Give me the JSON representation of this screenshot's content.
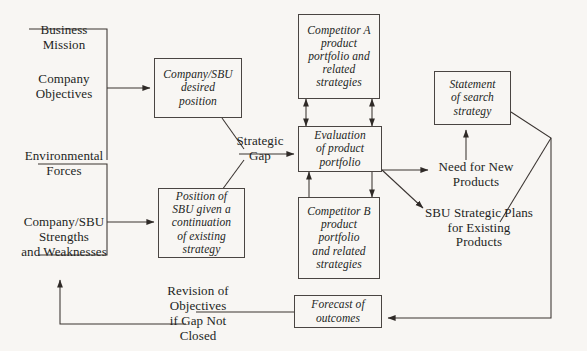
{
  "diagram": {
    "background_color": "#f8f6f3",
    "line_color": "#3a3431",
    "text_color": "#231f1d"
  },
  "inputs": [
    {
      "id": "business-mission",
      "label": "Business\nMission"
    },
    {
      "id": "company-objectives",
      "label": "Company\nObjectives"
    },
    {
      "id": "environmental-forces",
      "label": "Environmental\nForces"
    },
    {
      "id": "company-sbu-strengths",
      "label": "Company/SBU\nStrengths\nand Weaknesses"
    }
  ],
  "boxes": [
    {
      "id": "desired-position",
      "label": "Company/SBU\ndesired\nposition"
    },
    {
      "id": "position-continuation",
      "label": "Position of\nSBU given a\ncontinuation\nof existing\nstrategy"
    },
    {
      "id": "competitor-a",
      "label": "Competitor A\nproduct\nportfolio and\nrelated\nstrategies"
    },
    {
      "id": "competitor-b",
      "label": "Competitor B\nproduct\nportfolio\nand related\nstrategies"
    },
    {
      "id": "evaluation",
      "label": "Evaluation\nof product\nportfolio"
    },
    {
      "id": "search-strategy",
      "label": "Statement\nof search\nstrategy"
    },
    {
      "id": "forecast",
      "label": "Forecast of\noutcomes"
    }
  ],
  "labels": [
    {
      "id": "strategic-gap",
      "label": "Strategic\nGap"
    },
    {
      "id": "need-new-products",
      "label": "Need for New\nProducts"
    },
    {
      "id": "sbu-strategic-plans",
      "label": "SBU Strategic Plans\nfor Existing\nProducts"
    },
    {
      "id": "revision-objectives",
      "label": "Revision of\nObjectives\nif Gap Not\nClosed"
    }
  ]
}
